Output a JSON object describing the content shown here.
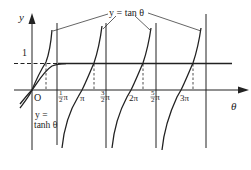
{
  "figure": {
    "labels": {
      "y_axis": "y",
      "x_axis": "θ",
      "origin": "O",
      "one": "1",
      "tan_label": "y = tan θ",
      "tanh_line1": "y =",
      "tanh_line2": "tanh θ"
    },
    "ticks": [
      {
        "id": "half-pi",
        "num": "1",
        "den": "2",
        "suffix": "π"
      },
      {
        "id": "pi",
        "text": "π"
      },
      {
        "id": "three-half-pi",
        "num": "3",
        "den": "2",
        "suffix": "π"
      },
      {
        "id": "two-pi",
        "text": "2π"
      },
      {
        "id": "five-half-pi",
        "num": "5",
        "den": "2",
        "suffix": "π"
      },
      {
        "id": "three-pi",
        "text": "3π"
      }
    ],
    "colors": {
      "line": "#222222",
      "background": "#ffffff"
    }
  }
}
